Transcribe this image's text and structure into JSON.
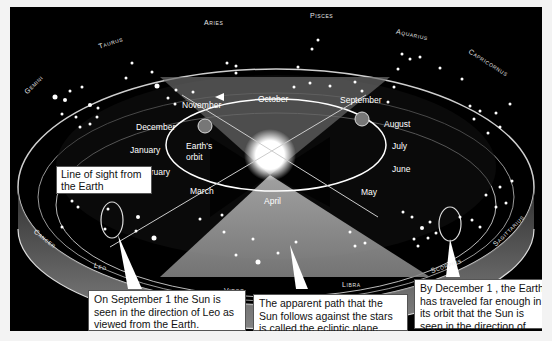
{
  "diagram": {
    "zodiac": [
      "Aries",
      "Pisces",
      "Aquarius",
      "Capricornus",
      "Sagittarius",
      "Scorpius",
      "Libra",
      "Virgo",
      "Leo",
      "Cancer",
      "Gemini",
      "Taurus"
    ],
    "months": {
      "october": "October",
      "november": "November",
      "september": "September",
      "august": "August",
      "july": "July",
      "june": "June",
      "may": "May",
      "april": "April",
      "march": "March",
      "february": "February",
      "january": "January",
      "december": "December"
    },
    "earth_orbit_label": "Earth's orbit",
    "line_of_sight_label": "Line of sight from the Earth",
    "callouts": [
      {
        "text": "On September 1 the Sun is seen in the direction of Leo as viewed from the Earth."
      },
      {
        "text": "The apparent path that the Sun follows against the stars is called the ecliptic plane."
      },
      {
        "text": "By December 1 , the Earth has traveled far enough in its orbit that the Sun is seen in the direction of Scorpius."
      }
    ],
    "colors": {
      "background": "#000000",
      "band": "#8a8a8a",
      "sun": "#ffffff",
      "callout_bg": "#ffffff"
    }
  }
}
